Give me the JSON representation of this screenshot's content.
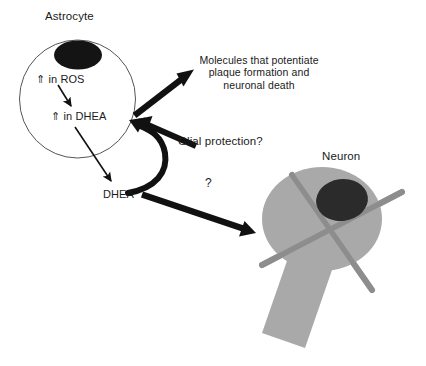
{
  "figure": {
    "width": 426,
    "height": 366,
    "background_color": "#ffffff"
  },
  "colors": {
    "text": "#1a1a1a",
    "cell_outline": "#4d4d4d",
    "astrocyte_nucleus": "#141414",
    "neuron_body": "#a8a8a8",
    "neuron_nucleus": "#2a2a2a",
    "dendrite": "#8a8a8a",
    "thick_arrow": "#111111",
    "thin_arrow": "#111111"
  },
  "astrocyte": {
    "label": "Astrocyte",
    "nucleus_name": "astrocyte-nucleus",
    "internal_labels": {
      "ros": {
        "arrow_glyph": "⇑",
        "text": " in ROS",
        "full": "⇑ in ROS"
      },
      "dhea": {
        "arrow_glyph": "⇑",
        "text": " in DHEA",
        "full": "⇑ in DHEA"
      }
    }
  },
  "neuron": {
    "label": "Neuron",
    "nucleus_name": "neuron-nucleus"
  },
  "labels": {
    "dhea_extracellular": "DHEA",
    "molecules": {
      "line1": "Molecules that potentiate",
      "line2": "plaque formation and",
      "line3": "neuronal death"
    },
    "glial_protection": "Glial protection?",
    "question_mark": "?"
  },
  "arrows": {
    "ros_to_dhea": "thin arrow from increased ROS to increased DHEA",
    "dhea_out": "thin arrow from intracellular DHEA to extracellular DHEA",
    "astrocyte_to_molecules": "thick arrow from astrocyte to molecules text",
    "molecules_to_astrocyte": "thick arrow from molecules region into astrocyte",
    "glial_protection_curve": "thick curved arrow from DHEA up into astrocyte",
    "dhea_to_neuron": "thick arrow from DHEA to neuron"
  }
}
